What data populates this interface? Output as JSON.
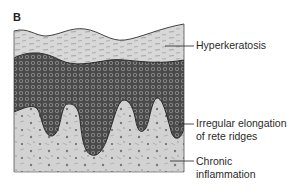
{
  "figure": {
    "panel_letter": "B",
    "labels": {
      "hyperkeratosis": "Hyperkeratosis",
      "rete_line1": "Irregular elongation",
      "rete_line2": "of rete ridges",
      "chronic_line1": "Chronic",
      "chronic_line2": "inflammation"
    },
    "layers": [
      {
        "name": "keratin layer",
        "color": "#d6d6d6"
      },
      {
        "name": "epidermis (cellular layer)",
        "color": "#5a5a5a"
      },
      {
        "name": "dermis",
        "color": "#cfcfcf"
      }
    ]
  }
}
